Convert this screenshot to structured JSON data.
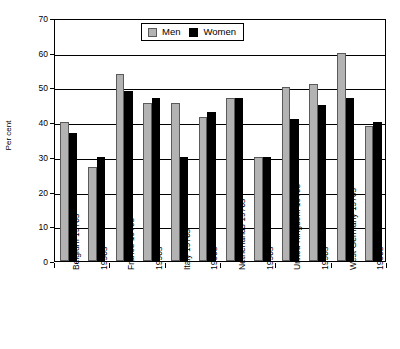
{
  "chart_data": {
    "type": "bar",
    "title": "",
    "xlabel": "",
    "ylabel": "Per cent",
    "ylim": [
      0,
      70
    ],
    "yticks": [
      0,
      10,
      20,
      30,
      40,
      50,
      60,
      70
    ],
    "grid": true,
    "legend_position": "top-center",
    "categories": [
      "Belgium 1970s",
      "1990s",
      "France 1970s",
      "1990s",
      "Italy 1970s",
      "1990s",
      "Netherlands 1970s",
      "1990s",
      "United Kingdom 1970s",
      "1990s",
      "West Germany 1970s",
      "1990s"
    ],
    "group_labels": [
      "Belgium",
      "France",
      "Italy",
      "Netherlands",
      "United Kingdom",
      "West Germany"
    ],
    "series": [
      {
        "name": "Men",
        "color": "#b3b3b3",
        "values": [
          40,
          27,
          54,
          45.5,
          45.5,
          41.5,
          47,
          30,
          50,
          51,
          60,
          39
        ]
      },
      {
        "name": "Women",
        "color": "#000000",
        "values": [
          37,
          30,
          49,
          47,
          30,
          43,
          47,
          30,
          41,
          45,
          47,
          40
        ]
      }
    ]
  },
  "legend": {
    "items": [
      {
        "label": "Men"
      },
      {
        "label": "Women"
      }
    ]
  }
}
